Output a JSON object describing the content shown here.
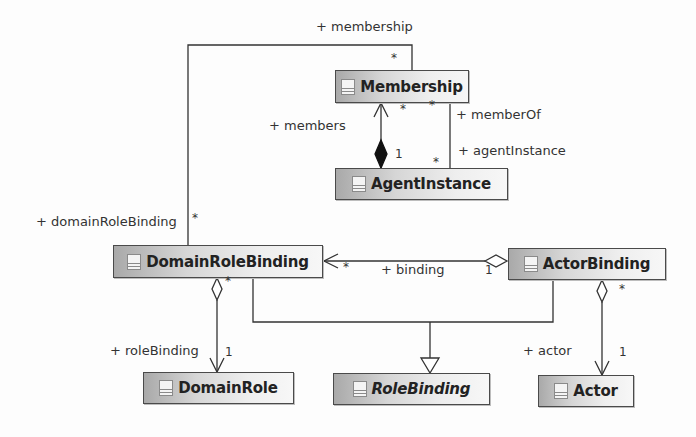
{
  "diagram": {
    "type": "UML class diagram",
    "classes": [
      {
        "id": "membership",
        "name": "Membership",
        "abstract": false
      },
      {
        "id": "agentInstance",
        "name": "AgentInstance",
        "abstract": false
      },
      {
        "id": "domainRoleBinding",
        "name": "DomainRoleBinding",
        "abstract": false
      },
      {
        "id": "actorBinding",
        "name": "ActorBinding",
        "abstract": false
      },
      {
        "id": "domainRole",
        "name": "DomainRole",
        "abstract": false
      },
      {
        "id": "roleBinding",
        "name": "RoleBinding",
        "abstract": true
      },
      {
        "id": "actor",
        "name": "Actor",
        "abstract": false
      }
    ],
    "role_labels": {
      "membership": "+ membership",
      "members": "+ members",
      "memberOf": "+ memberOf",
      "agentInstance": "+ agentInstance",
      "domainRoleBinding": "+ domainRoleBinding",
      "binding": "+ binding",
      "roleBinding": "+ roleBinding",
      "actor": "+ actor"
    },
    "multiplicities": {
      "membership_top": "*",
      "domainRoleBinding_left": "*",
      "members_star": "*",
      "membership_right_star": "*",
      "members_one": "1",
      "agentInstance_star": "*",
      "binding_star": "*",
      "binding_one": "1",
      "drb_agg_star": "*",
      "roleBinding_one": "1",
      "ab_agg_star": "*",
      "actor_one": "1"
    },
    "relationships": [
      {
        "from": "DomainRoleBinding",
        "to": "Membership",
        "kind": "association",
        "role": "+ membership",
        "source_role": "+ domainRoleBinding"
      },
      {
        "from": "AgentInstance",
        "to": "Membership",
        "kind": "composition",
        "role": "+ members"
      },
      {
        "from": "Membership",
        "to": "AgentInstance",
        "kind": "association",
        "roles": [
          "+ memberOf",
          "+ agentInstance"
        ]
      },
      {
        "from": "ActorBinding",
        "to": "DomainRoleBinding",
        "kind": "aggregation",
        "role": "+ binding"
      },
      {
        "from": "DomainRoleBinding",
        "to": "DomainRole",
        "kind": "aggregation",
        "role": "+ roleBinding"
      },
      {
        "from": "ActorBinding",
        "to": "Actor",
        "kind": "aggregation",
        "role": "+ actor"
      },
      {
        "from": "DomainRoleBinding",
        "to": "RoleBinding",
        "kind": "generalization"
      },
      {
        "from": "ActorBinding",
        "to": "RoleBinding",
        "kind": "generalization"
      }
    ]
  }
}
